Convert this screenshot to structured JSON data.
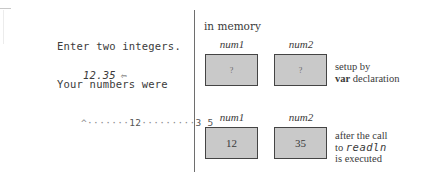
{
  "left_panel": {
    "prompt_text": "Enter two integers.",
    "user_input": "12.35",
    "return_icon": "return-key-icon",
    "return_glyph": "⇦",
    "result_text": "Your numbers were",
    "output_line": {
      "leading_dots": "^·······",
      "first_value": "12",
      "middle_dots": "·········",
      "second_value": "3 5"
    }
  },
  "right_panel": {
    "title": "in memory",
    "rows": [
      {
        "cells": [
          {
            "name": "num1",
            "value": "?"
          },
          {
            "name": "num2",
            "value": "?"
          }
        ],
        "caption": {
          "line1": "setup by",
          "keyword": "var",
          "line2_rest": " declaration"
        }
      },
      {
        "cells": [
          {
            "name": "num1",
            "value": "12"
          },
          {
            "name": "num2",
            "value": "35"
          }
        ],
        "caption": {
          "line1": "after the call",
          "line2_prefix": "to ",
          "code": "readln",
          "line3": "is executed"
        }
      }
    ]
  },
  "colors": {
    "box_fill": "#c9c9c9",
    "box_border": "#444444",
    "divider": "#6e6e6e",
    "text": "#3a3a3a"
  }
}
